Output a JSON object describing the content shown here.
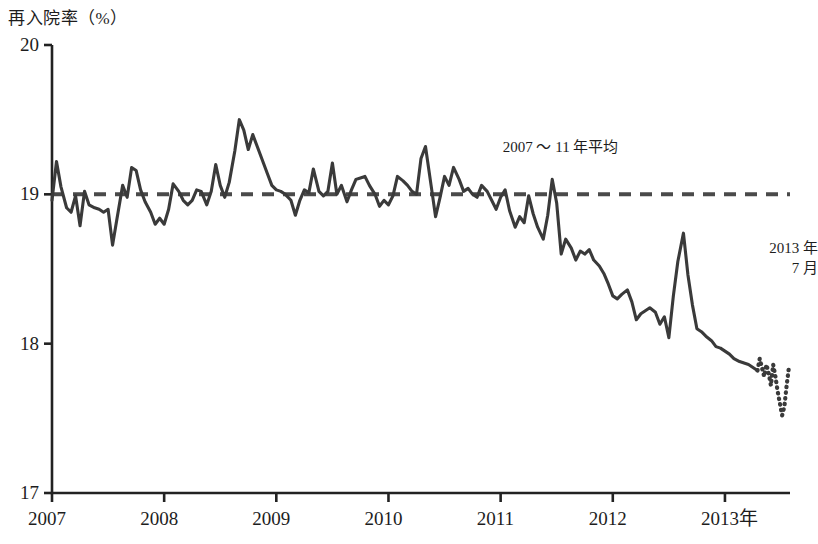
{
  "chart_data": {
    "type": "line",
    "title": "再入院率（%）",
    "xlabel": "",
    "ylabel": "再入院率（%）",
    "ylim": [
      17,
      20
    ],
    "xlim": [
      2007.0,
      2013.58
    ],
    "yticks": [
      "20",
      "19",
      "18",
      "17"
    ],
    "ytick_values": [
      20,
      19,
      18,
      17
    ],
    "xticks": [
      "2007",
      "2008",
      "2009",
      "2010",
      "2011",
      "2012",
      "2013年"
    ],
    "xtick_values": [
      2007,
      2008,
      2009,
      2010,
      2011,
      2012,
      2013
    ],
    "grid": false,
    "legend": "none",
    "annotations": [
      {
        "name": "average-line-label",
        "text": "2007 〜 11 年平均",
        "x": 2012.05,
        "y": 19.32
      },
      {
        "name": "last-point-label",
        "text": "2013 年\n7 月",
        "x": 2013.25,
        "y": 18.63
      }
    ],
    "reference_line": {
      "name": "2007-11-average",
      "value": 19.0,
      "style": "dashed",
      "label": "2007 〜 11 年平均"
    },
    "series": [
      {
        "name": "readmission-rate-solid",
        "style": "solid",
        "x": [
          2007.0,
          2007.04,
          2007.08,
          2007.13,
          2007.17,
          2007.21,
          2007.25,
          2007.29,
          2007.33,
          2007.38,
          2007.42,
          2007.46,
          2007.5,
          2007.54,
          2007.58,
          2007.63,
          2007.67,
          2007.71,
          2007.75,
          2007.79,
          2007.83,
          2007.88,
          2007.92,
          2007.96,
          2008.0,
          2008.04,
          2008.08,
          2008.13,
          2008.17,
          2008.21,
          2008.25,
          2008.29,
          2008.33,
          2008.38,
          2008.42,
          2008.46,
          2008.5,
          2008.54,
          2008.58,
          2008.63,
          2008.67,
          2008.71,
          2008.75,
          2008.79,
          2008.83,
          2008.88,
          2008.92,
          2008.96,
          2009.0,
          2009.04,
          2009.08,
          2009.13,
          2009.17,
          2009.21,
          2009.25,
          2009.29,
          2009.33,
          2009.38,
          2009.42,
          2009.46,
          2009.5,
          2009.54,
          2009.58,
          2009.63,
          2009.67,
          2009.71,
          2009.75,
          2009.79,
          2009.83,
          2009.88,
          2009.92,
          2009.96,
          2010.0,
          2010.04,
          2010.08,
          2010.13,
          2010.17,
          2010.21,
          2010.25,
          2010.29,
          2010.33,
          2010.38,
          2010.42,
          2010.46,
          2010.5,
          2010.54,
          2010.58,
          2010.63,
          2010.67,
          2010.71,
          2010.75,
          2010.79,
          2010.83,
          2010.88,
          2010.92,
          2010.96,
          2011.0,
          2011.04,
          2011.08,
          2011.13,
          2011.17,
          2011.21,
          2011.25,
          2011.29,
          2011.33,
          2011.38,
          2011.42,
          2011.46,
          2011.5,
          2011.54,
          2011.58,
          2011.63,
          2011.67,
          2011.71,
          2011.75,
          2011.79,
          2011.83,
          2011.88,
          2011.92,
          2011.96,
          2012.0,
          2012.04,
          2012.08,
          2012.13,
          2012.17,
          2012.21,
          2012.25,
          2012.29,
          2012.33,
          2012.38,
          2012.42,
          2012.46,
          2012.5,
          2012.54,
          2012.58,
          2012.63,
          2012.67,
          2012.71,
          2012.75,
          2012.79,
          2012.83,
          2012.88,
          2012.92,
          2012.96,
          2013.0,
          2013.04,
          2013.08,
          2013.13,
          2013.21,
          2013.29
        ],
        "y": [
          18.96,
          19.22,
          19.05,
          18.91,
          18.88,
          18.99,
          18.79,
          19.02,
          18.93,
          18.91,
          18.9,
          18.88,
          18.9,
          18.66,
          18.84,
          19.06,
          18.98,
          19.18,
          19.16,
          19.03,
          18.95,
          18.88,
          18.8,
          18.84,
          18.8,
          18.9,
          19.07,
          19.02,
          18.96,
          18.93,
          18.96,
          19.03,
          19.02,
          18.93,
          19.02,
          19.2,
          19.06,
          18.98,
          19.08,
          19.29,
          19.5,
          19.43,
          19.3,
          19.4,
          19.32,
          19.22,
          19.14,
          19.06,
          19.03,
          19.02,
          19.0,
          18.96,
          18.86,
          18.96,
          19.03,
          19.01,
          19.17,
          19.02,
          18.99,
          19.02,
          19.21,
          19.0,
          19.06,
          18.95,
          19.03,
          19.1,
          19.11,
          19.12,
          19.06,
          19.0,
          18.92,
          18.96,
          18.93,
          18.99,
          19.12,
          19.09,
          19.06,
          19.02,
          19.0,
          19.24,
          19.32,
          19.06,
          18.85,
          18.98,
          19.12,
          19.06,
          19.18,
          19.1,
          19.02,
          19.04,
          19.0,
          18.98,
          19.06,
          19.02,
          18.96,
          18.9,
          18.98,
          19.03,
          18.89,
          18.78,
          18.85,
          18.81,
          18.99,
          18.87,
          18.78,
          18.7,
          18.86,
          19.1,
          18.94,
          18.6,
          18.7,
          18.64,
          18.56,
          18.62,
          18.6,
          18.63,
          18.56,
          18.52,
          18.47,
          18.4,
          18.32,
          18.3,
          18.33,
          18.36,
          18.28,
          18.16,
          18.2,
          18.22,
          18.24,
          18.21,
          18.13,
          18.18,
          18.04,
          18.32,
          18.55,
          18.74,
          18.46,
          18.26,
          18.1,
          18.08,
          18.05,
          18.02,
          17.98,
          17.97,
          17.95,
          17.93,
          17.9,
          17.88,
          17.86,
          17.82
        ]
      },
      {
        "name": "readmission-rate-dotted",
        "style": "dotted",
        "x": [
          2013.29,
          2013.31,
          2013.33,
          2013.35,
          2013.37,
          2013.39,
          2013.41,
          2013.43,
          2013.45,
          2013.47,
          2013.49,
          2013.51,
          2013.53,
          2013.55,
          2013.57
        ],
        "y": [
          17.82,
          17.9,
          17.84,
          17.78,
          17.86,
          17.8,
          17.72,
          17.86,
          17.78,
          17.68,
          17.6,
          17.52,
          17.58,
          17.72,
          17.84
        ]
      }
    ]
  },
  "axis": {
    "title": "再入院率（%）"
  }
}
